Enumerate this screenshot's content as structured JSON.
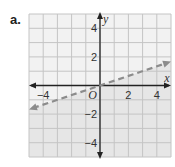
{
  "problem_label": "a.",
  "chart_data": {
    "type": "line",
    "title": "",
    "xlabel": "x",
    "ylabel": "y",
    "xlim": [
      -5,
      5
    ],
    "ylim": [
      -5,
      5
    ],
    "grid": true,
    "origin_label": "O",
    "x_ticks": [
      {
        "value": -4,
        "label": "−4"
      },
      {
        "value": 2,
        "label": "2"
      },
      {
        "value": 4,
        "label": "4"
      }
    ],
    "y_ticks": [
      {
        "value": 4,
        "label": "4"
      },
      {
        "value": 2,
        "label": "2"
      },
      {
        "value": -2,
        "label": "−2"
      },
      {
        "value": -4,
        "label": "−4"
      }
    ],
    "series": [
      {
        "name": "boundary line",
        "style": "dashed",
        "equation": "y = x/3",
        "x": [
          -5,
          5
        ],
        "y": [
          -1.67,
          1.67
        ],
        "arrows": "both"
      }
    ],
    "shaded_region": "below line",
    "colors": {
      "grid_background": "#f2f2f2",
      "grid_line": "#c4c4c4",
      "shade": "#e6e6e6",
      "dashed_line": "#8c8c8c",
      "axis": "#222222"
    }
  }
}
